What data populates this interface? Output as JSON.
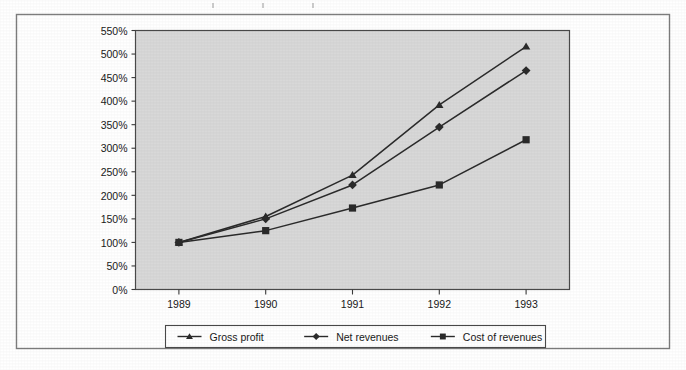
{
  "figure": {
    "frame_color": "#7d7d7d",
    "plot_background": "#d8d8d8",
    "line_color": "#2b2b2b",
    "text_color": "#1a1a1a"
  },
  "chart_data": {
    "type": "line",
    "title": "",
    "subtitle": "",
    "xlabel": "",
    "ylabel": "",
    "categories": [
      "1989",
      "1990",
      "1991",
      "1992",
      "1993"
    ],
    "x_tick_labels": [
      "1989",
      "1990",
      "1991",
      "1992",
      "1993"
    ],
    "y_tick_labels": [
      "0%",
      "50%",
      "100%",
      "150%",
      "200%",
      "250%",
      "300%",
      "350%",
      "400%",
      "450%",
      "500%",
      "550%"
    ],
    "y_tick_values": [
      0,
      50,
      100,
      150,
      200,
      250,
      300,
      350,
      400,
      450,
      500,
      550
    ],
    "ylim": [
      0,
      550
    ],
    "y_tick_step": 50,
    "grid": false,
    "legend_position": "bottom",
    "value_suffix": "%",
    "series": [
      {
        "name": "Gross profit",
        "marker": "triangle",
        "values": [
          100,
          155,
          243,
          392,
          516
        ]
      },
      {
        "name": "Net revenues",
        "marker": "diamond",
        "values": [
          100,
          150,
          222,
          345,
          465
        ]
      },
      {
        "name": "Cost of revenues",
        "marker": "square",
        "values": [
          100,
          125,
          173,
          222,
          318
        ]
      }
    ]
  },
  "legend": {
    "items": [
      {
        "label": "Gross profit",
        "marker": "triangle"
      },
      {
        "label": "Net revenues",
        "marker": "diamond"
      },
      {
        "label": "Cost of revenues",
        "marker": "square"
      }
    ]
  }
}
